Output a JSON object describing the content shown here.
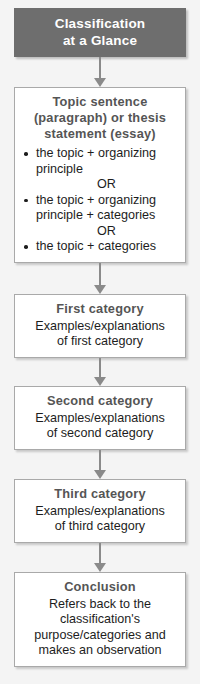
{
  "diagram": {
    "header": {
      "lines": [
        "Classification",
        "at a Glance"
      ]
    },
    "nodes": [
      {
        "id": "topic-sentence",
        "title_lines": [
          "Topic sentence",
          "(paragraph) or thesis",
          "statement (essay)"
        ],
        "bullets": [
          {
            "lines": [
              "the topic + organizing",
              "principle"
            ]
          },
          {
            "lines": [
              "the topic + organizing",
              "principle + categories"
            ]
          },
          {
            "lines": [
              "the topic + categories"
            ]
          }
        ],
        "separators": [
          "OR",
          "OR"
        ]
      },
      {
        "id": "first-category",
        "title_lines": [
          "First category"
        ],
        "body_lines": [
          "Examples/explanations",
          "of first category"
        ]
      },
      {
        "id": "second-category",
        "title_lines": [
          "Second category"
        ],
        "body_lines": [
          "Examples/explanations",
          "of second category"
        ]
      },
      {
        "id": "third-category",
        "title_lines": [
          "Third category"
        ],
        "body_lines": [
          "Examples/explanations",
          "of third category"
        ]
      },
      {
        "id": "conclusion",
        "title_lines": [
          "Conclusion"
        ],
        "body_lines": [
          "Refers back to the",
          "classification's",
          "purpose/categories and",
          "makes an observation"
        ]
      }
    ],
    "colors": {
      "header_fill": "#6e6e6e",
      "header_text": "#ffffff",
      "box_fill": "#ffffff",
      "box_border": "#a9a9a9",
      "title_text": "#555555",
      "body_text": "#1d1d1d",
      "arrow": "#8a8a8a",
      "background": "#f4f4f4"
    }
  }
}
